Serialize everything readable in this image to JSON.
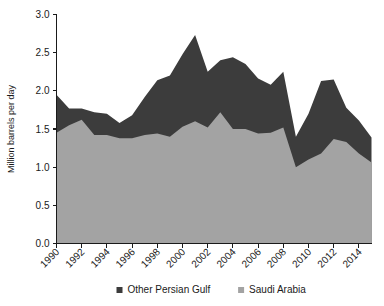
{
  "chart_data": {
    "type": "area",
    "title": "",
    "subtitle": "",
    "xlabel": "",
    "ylabel": "Million barrels per day",
    "stacked": true,
    "grid": false,
    "legend_position": "bottom",
    "xlim": [
      1990,
      2015
    ],
    "ylim": [
      0.0,
      3.0
    ],
    "x": [
      1990,
      1991,
      1992,
      1993,
      1994,
      1995,
      1996,
      1997,
      1998,
      1999,
      2000,
      2001,
      2002,
      2003,
      2004,
      2005,
      2006,
      2007,
      2008,
      2009,
      2010,
      2011,
      2012,
      2013,
      2014,
      2015
    ],
    "xticks": [
      1990,
      1992,
      1994,
      1996,
      1998,
      2000,
      2002,
      2004,
      2006,
      2008,
      2010,
      2012,
      2014
    ],
    "xticklabels": [
      "1990",
      "1992",
      "1994",
      "1996",
      "1998",
      "2000",
      "2002",
      "2004",
      "2006",
      "2008",
      "2010",
      "2012",
      "2014"
    ],
    "yticks": [
      0.0,
      0.5,
      1.0,
      1.5,
      2.0,
      2.5,
      3.0
    ],
    "yticklabels": [
      "0.0",
      "0.5",
      "1.0",
      "1.5",
      "2.0",
      "2.5",
      "3.0"
    ],
    "series": [
      {
        "name": "Saudi Arabia",
        "color": "#a3a3a3",
        "values": [
          1.45,
          1.55,
          1.62,
          1.42,
          1.42,
          1.38,
          1.38,
          1.42,
          1.44,
          1.4,
          1.53,
          1.6,
          1.52,
          1.72,
          1.5,
          1.5,
          1.44,
          1.45,
          1.52,
          1.0,
          1.1,
          1.18,
          1.37,
          1.33,
          1.18,
          1.06
        ]
      },
      {
        "name": "Other Persian Gulf",
        "color": "#3c3c3c",
        "values": [
          0.5,
          0.22,
          0.15,
          0.3,
          0.28,
          0.2,
          0.3,
          0.5,
          0.7,
          0.8,
          0.95,
          1.13,
          0.73,
          0.68,
          0.94,
          0.85,
          0.72,
          0.63,
          0.73,
          0.4,
          0.6,
          0.95,
          0.78,
          0.45,
          0.43,
          0.33
        ]
      }
    ],
    "legend": [
      {
        "label": "Other Persian Gulf",
        "color": "#3c3c3c"
      },
      {
        "label": "Saudi Arabia",
        "color": "#a3a3a3"
      }
    ]
  }
}
